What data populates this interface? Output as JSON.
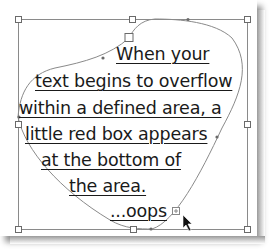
{
  "text_frame": {
    "lines": [
      "When your",
      "text begins to overflow",
      "within a defined area, a",
      "little red box appears",
      "at the bottom of",
      "the area.",
      "...oops"
    ]
  },
  "overflow_indicator": {
    "icon": "overflow-plus-icon",
    "color": "#888888"
  },
  "cursor": {
    "icon": "arrow-cursor-icon"
  },
  "colors": {
    "frame_stroke": "#8a8a8a",
    "text": "#1a1a1a",
    "background": "#ffffff"
  }
}
